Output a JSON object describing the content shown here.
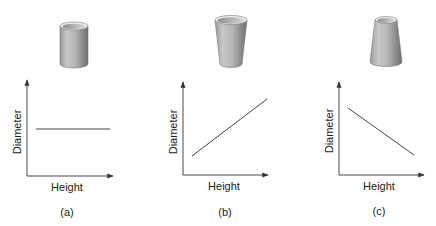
{
  "figure": {
    "panels": [
      {
        "id": "a",
        "caption": "(a)",
        "shape": "cylinder",
        "xlabel": "Height",
        "ylabel": "Diameter",
        "relation": "constant"
      },
      {
        "id": "b",
        "caption": "(b)",
        "shape": "cup-widening-upward",
        "xlabel": "Height",
        "ylabel": "Diameter",
        "relation": "increasing"
      },
      {
        "id": "c",
        "caption": "(c)",
        "shape": "cup-narrowing-upward",
        "xlabel": "Height",
        "ylabel": "Diameter",
        "relation": "decreasing"
      }
    ],
    "colors": {
      "axis": "#333333",
      "line": "#444444",
      "shape_light": "#e6e6e6",
      "shape_dark": "#7a7a7a",
      "text": "#222222"
    }
  }
}
